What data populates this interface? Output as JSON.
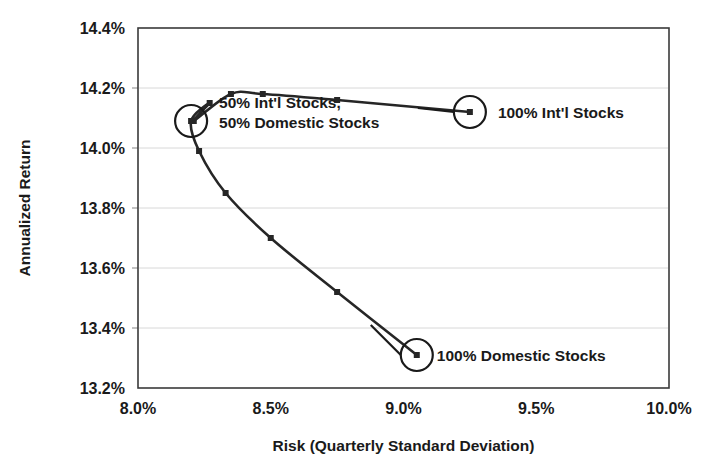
{
  "chart_data": {
    "type": "line",
    "title": "",
    "subtitle": "",
    "xlabel": "Risk (Quarterly Standard Deviation)",
    "ylabel": "Annualized Return",
    "xlim": [
      8.0,
      10.0
    ],
    "ylim": [
      13.2,
      14.4
    ],
    "x_tick_labels": [
      "8.0%",
      "8.5%",
      "9.0%",
      "9.5%",
      "10.0%"
    ],
    "x_tick_values": [
      8.0,
      8.5,
      9.0,
      9.5,
      10.0
    ],
    "y_tick_labels": [
      "13.2%",
      "13.4%",
      "13.6%",
      "13.8%",
      "14.0%",
      "14.2%",
      "14.4%"
    ],
    "y_tick_values": [
      13.2,
      13.4,
      13.6,
      13.8,
      14.0,
      14.2,
      14.4
    ],
    "grid": true,
    "grid_axis": "y",
    "legend": false,
    "marker": "square",
    "series": [
      {
        "name": "Efficient Frontier",
        "x": [
          8.27,
          8.21,
          8.35,
          8.47,
          8.75,
          9.25,
          8.2,
          8.23,
          8.33,
          8.5,
          8.75,
          9.05
        ],
        "y": [
          14.15,
          14.09,
          14.18,
          14.18,
          14.16,
          14.12,
          14.09,
          13.99,
          13.85,
          13.7,
          13.52,
          13.31
        ]
      }
    ],
    "points": [
      {
        "x": 8.27,
        "y": 14.15,
        "branch": "upper"
      },
      {
        "x": 8.21,
        "y": 14.09,
        "branch": "upper"
      },
      {
        "x": 8.35,
        "y": 14.18,
        "branch": "upper"
      },
      {
        "x": 8.47,
        "y": 14.18,
        "branch": "upper"
      },
      {
        "x": 8.75,
        "y": 14.16,
        "branch": "upper"
      },
      {
        "x": 9.25,
        "y": 14.12,
        "branch": "upper"
      },
      {
        "x": 8.2,
        "y": 14.09,
        "branch": "pivot"
      },
      {
        "x": 8.23,
        "y": 13.99,
        "branch": "lower"
      },
      {
        "x": 8.33,
        "y": 13.85,
        "branch": "lower"
      },
      {
        "x": 8.5,
        "y": 13.7,
        "branch": "lower"
      },
      {
        "x": 8.75,
        "y": 13.52,
        "branch": "lower"
      },
      {
        "x": 9.05,
        "y": 13.31,
        "branch": "lower"
      }
    ],
    "annotations": [
      {
        "id": "intl-100",
        "text": "100% Int'l Stocks",
        "x": 9.25,
        "y": 14.12,
        "lines": [
          "100% Int'l Stocks"
        ]
      },
      {
        "id": "mix-50-50",
        "text": "50% Int'l Stocks, 50% Domestic Stocks",
        "x": 8.2,
        "y": 14.09,
        "lines": [
          "50% Int'l Stocks,",
          "50% Domestic Stocks"
        ]
      },
      {
        "id": "domestic-100",
        "text": "100% Domestic Stocks",
        "x": 9.05,
        "y": 13.31,
        "lines": [
          "100% Domestic Stocks"
        ]
      }
    ],
    "colors": {
      "line": "#262626",
      "marker": "#262626",
      "grid": "#d8d8d8",
      "frame": "#3a3a3a",
      "text": "#1a1a1a",
      "background": "#ffffff"
    }
  }
}
